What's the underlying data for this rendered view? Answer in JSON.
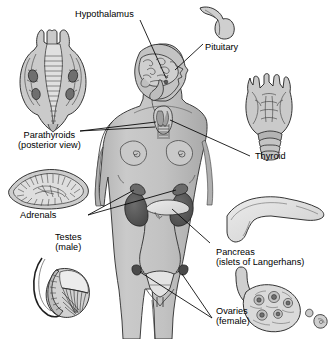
{
  "figure": {
    "background_color": "#ffffff",
    "ink_color": "#000000",
    "body_fill": "#c6c6c6",
    "body_shadow": "#a8a8a8",
    "organ_dark": "#555555",
    "organ_mid": "#9b9b9b",
    "organ_light": "#d8d8d8",
    "organ_pale": "#e6e6e6"
  },
  "labels": {
    "hypothalamus": {
      "line1": "Hypothalamus",
      "line2": ""
    },
    "pituitary": {
      "line1": "Pituitary",
      "line2": ""
    },
    "parathyroids": {
      "line1": "Parathyroids",
      "line2": "(posterior view)"
    },
    "thyroid": {
      "line1": "Thyroid",
      "line2": ""
    },
    "adrenals": {
      "line1": "Adrenals",
      "line2": ""
    },
    "testes": {
      "line1": "Testes",
      "line2": "(male)"
    },
    "pancreas": {
      "line1": "Pancreas",
      "line2": "(islets of Langerhans)"
    },
    "ovaries": {
      "line1": "Ovaries",
      "line2": "(female)"
    }
  },
  "insets": [
    {
      "name": "pituitary-inset",
      "description": "hook shaped pituitary gland",
      "position": "top-right"
    },
    {
      "name": "parathyroids-inset",
      "description": "posterior larynx view with parathyroid glands",
      "position": "top-left"
    },
    {
      "name": "thyroid-inset",
      "description": "anterior larynx with thyroid gland and tracheal rings",
      "position": "right"
    },
    {
      "name": "adrenals-inset",
      "description": "sectioned adrenal gland with cortex and medulla",
      "position": "left"
    },
    {
      "name": "testes-inset",
      "description": "testis with epididymis and seminiferous tubules",
      "position": "lower-left"
    },
    {
      "name": "pancreas-inset",
      "description": "pancreas head body and tail",
      "position": "lower-right"
    },
    {
      "name": "ovaries-inset",
      "description": "sectioned ovary with follicles",
      "position": "bottom-right"
    }
  ],
  "body_parts": [
    {
      "name": "head-brain",
      "description": "sagittal brain inside head facing right"
    },
    {
      "name": "neck-thyroid",
      "description": "thyroid gland on trachea in neck"
    },
    {
      "name": "kidneys",
      "description": "pair of kidneys with adrenal caps"
    },
    {
      "name": "pancreas-in-body",
      "description": "pancreas across midline"
    },
    {
      "name": "uterus-ovaries",
      "description": "uterus with fallopian tubes and ovaries"
    }
  ]
}
